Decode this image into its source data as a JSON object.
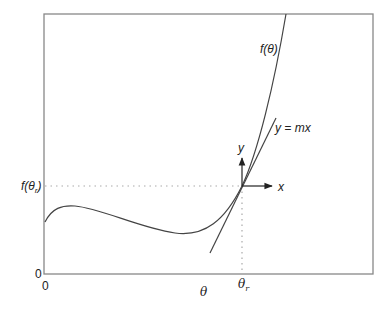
{
  "diagram": {
    "curve_label": "f(θ)",
    "tangent_label": "y = mx",
    "local_axes": {
      "x_label": "x",
      "y_label": "y"
    },
    "y_axis": {
      "tick_label": "f(θr)",
      "tick_base": "f(θ",
      "tick_sub": "r",
      "tick_close": ")",
      "origin_label": "0"
    },
    "x_axis": {
      "title": "θ",
      "tick_label": "θr",
      "tick_base": "θ",
      "tick_sub": "r",
      "origin_label": "0"
    }
  },
  "colors": {
    "frame": "#888888",
    "curve": "#444444",
    "dotted": "#aaaaaa",
    "text": "#222222"
  }
}
